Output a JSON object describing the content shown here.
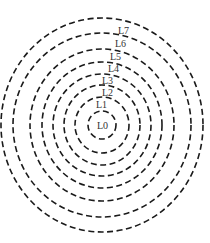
{
  "diagram": {
    "type": "concentric-dashed-circles",
    "center": {
      "x": 102,
      "y": 125
    },
    "stroke_color": "#1a1a1a",
    "label_color": "#333333",
    "levels": [
      {
        "label": "L0",
        "rx": 14,
        "ry": 14,
        "label_x": 97,
        "label_y": 129
      },
      {
        "label": "L1",
        "rx": 27,
        "ry": 28,
        "label_x": 96,
        "label_y": 108
      },
      {
        "label": "L2",
        "rx": 38,
        "ry": 40,
        "label_x": 102,
        "label_y": 96
      },
      {
        "label": "L3",
        "rx": 49,
        "ry": 51,
        "label_x": 102,
        "label_y": 84
      },
      {
        "label": "L4",
        "rx": 60,
        "ry": 63,
        "label_x": 108,
        "label_y": 72
      },
      {
        "label": "L5",
        "rx": 72,
        "ry": 76,
        "label_x": 110,
        "label_y": 60
      },
      {
        "label": "L6",
        "rx": 89,
        "ry": 92,
        "label_x": 115,
        "label_y": 47
      },
      {
        "label": "L7",
        "rx": 101,
        "ry": 107,
        "label_x": 118,
        "label_y": 34
      }
    ]
  }
}
